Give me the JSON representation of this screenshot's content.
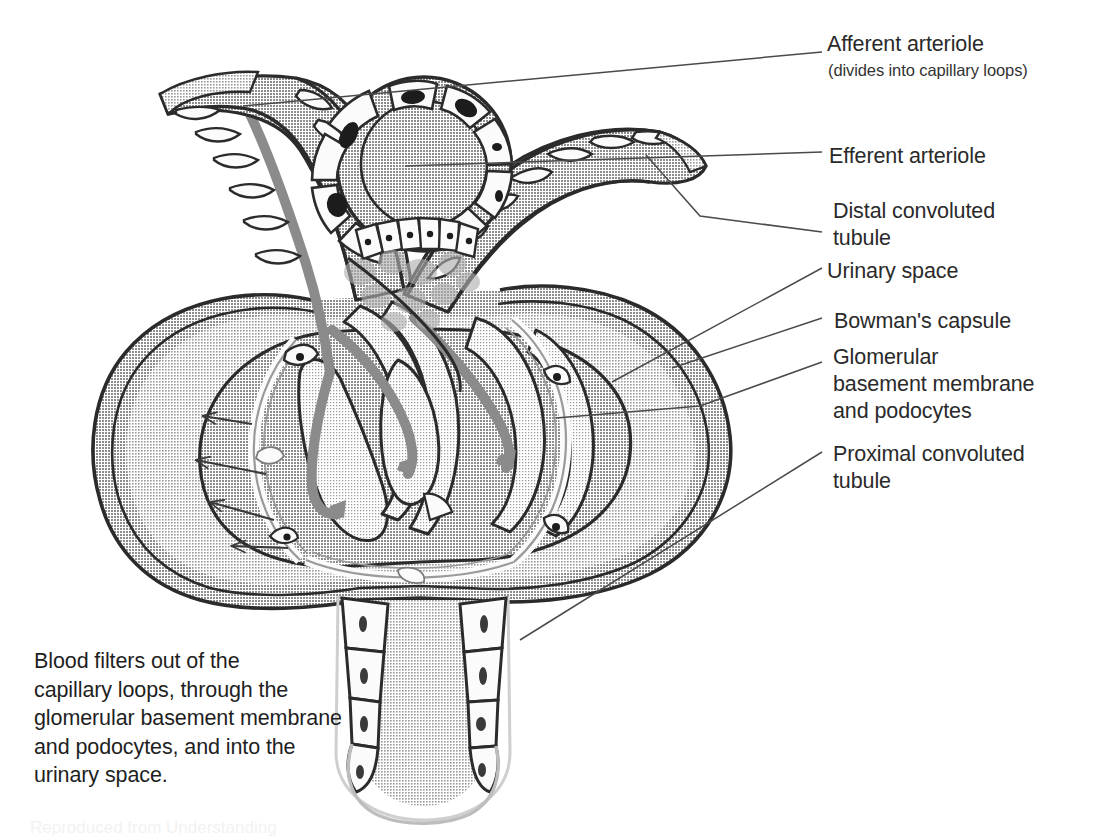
{
  "figure": {
    "background_color": "#ffffff",
    "ink_color": "#2a2a2a",
    "tones": {
      "capsule_fill": "#d2d2d2",
      "glomerulus_fill": "#bdbdbd",
      "capillary_lumen_fill": "#e0e0e0",
      "vessel_outer_fill": "#c7c7c7",
      "blood_flow_gray": "#8b8b8b",
      "cell_white": "#fbfbfb",
      "nucleus_dark": "#1c1c1c",
      "mesangium_blob": "#aeaeae",
      "outline_dark": "#2b2b2b"
    }
  },
  "labels": {
    "afferent_arteriole": "Afferent arteriole",
    "afferent_arteriole_sub": "(divides into capillary loops)",
    "efferent_arteriole": "Efferent arteriole",
    "distal_convoluted_tubule": "Distal convoluted\ntubule",
    "urinary_space": "Urinary space",
    "bowmans_capsule": "Bowman's capsule",
    "glomerular_membrane": "Glomerular\nbasement membrane\nand podocytes",
    "proximal_convoluted_tubule": "Proximal convoluted\ntubule"
  },
  "caption": {
    "text": "Blood filters out of the\ncapillary loops, through the\nglomerular basement membrane\nand podocytes, and into the\nurinary space."
  },
  "artifact": {
    "bottom_text": "Reproduced from Understanding"
  },
  "annotations": {
    "filtration_arrow_count": 4,
    "filtration_arrow_direction": "outward-left into urinary space",
    "blood_flow_arrow_count": 3,
    "blood_flow_direction": "afferent in, through capillary loops, efferent out",
    "macula_densa_cell_count": 6,
    "dct_epithelial_cell_count": 8,
    "pct_cells_left": 4,
    "pct_cells_right": 4
  },
  "leader_lines": [
    {
      "name": "afferent-leader",
      "from": [
        822,
        52
      ],
      "to": [
        243,
        106
      ]
    },
    {
      "name": "efferent-leader",
      "from": [
        822,
        152
      ],
      "to": [
        405,
        166
      ]
    },
    {
      "name": "distal-leader",
      "from": [
        822,
        232
      ],
      "to": [
        646,
        155
      ]
    },
    {
      "name": "urinary-leader",
      "from": [
        822,
        268
      ],
      "to": [
        612,
        382
      ]
    },
    {
      "name": "bowman-leader",
      "from": [
        822,
        318
      ],
      "to": [
        672,
        368
      ]
    },
    {
      "name": "glomerular-leader",
      "from": [
        822,
        362
      ],
      "to": [
        556,
        418
      ]
    },
    {
      "name": "proximal-leader",
      "from": [
        822,
        452
      ],
      "to": [
        520,
        640
      ]
    }
  ]
}
